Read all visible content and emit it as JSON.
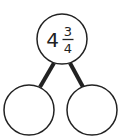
{
  "diagram": {
    "type": "number-bond",
    "whole": {
      "whole_part": "4",
      "numerator": "3",
      "denominator": "4"
    },
    "parts": [
      {
        "value": ""
      },
      {
        "value": ""
      }
    ],
    "colors": {
      "stroke": "#222222",
      "background": "#ffffff"
    }
  }
}
